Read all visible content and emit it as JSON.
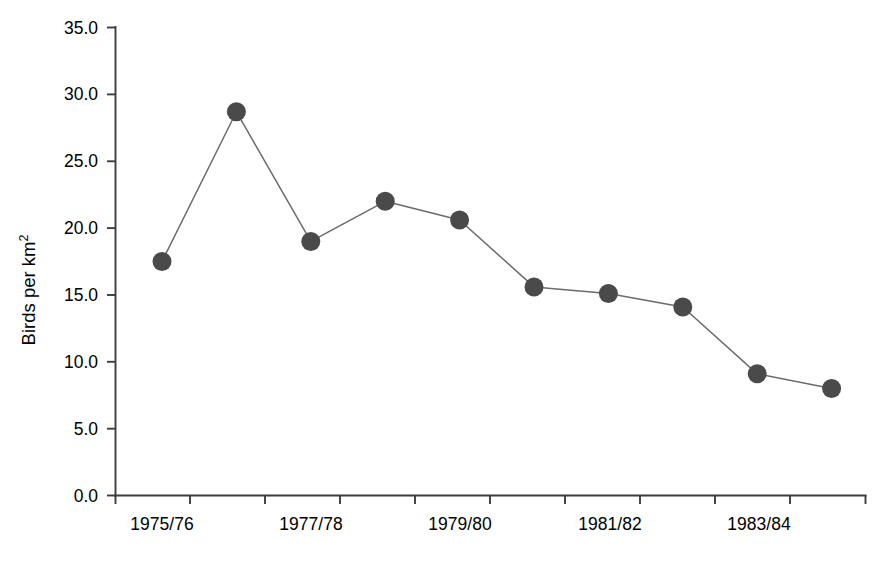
{
  "chart_data": {
    "type": "line",
    "title": "",
    "xlabel": "",
    "ylabel": "Birds per km²",
    "ylabel_base": "Birds per km",
    "ylabel_superscript": "2",
    "ylim": [
      0.0,
      35.0
    ],
    "ytick_step": 5.0,
    "ytick_labels": [
      "35.0",
      "30.0",
      "25.0",
      "20.0",
      "15.0",
      "10.0",
      "5.0",
      "0.0"
    ],
    "ytick_values": [
      35.0,
      30.0,
      25.0,
      20.0,
      15.0,
      10.0,
      5.0,
      0.0
    ],
    "grid": false,
    "legend": false,
    "marker": "filled-circle",
    "marker_color": "#4a4a4a",
    "line_color": "#6b6b6b",
    "axis_color": "#3d3d3d",
    "categories": [
      "1975/76",
      "1976/77",
      "1977/78",
      "1978/79",
      "1979/80",
      "1980/81",
      "1981/82",
      "1982/83",
      "1983/84",
      "1984/85"
    ],
    "xtick_labels_shown": [
      "1975/76",
      "",
      "1977/78",
      "",
      "1979/80",
      "",
      "1981/82",
      "",
      "1983/84",
      ""
    ],
    "values": [
      17.5,
      28.7,
      19.0,
      22.0,
      20.6,
      15.6,
      15.1,
      14.1,
      9.1,
      8.0
    ],
    "series": [
      {
        "name": "Birds per km²",
        "values": [
          17.5,
          28.7,
          19.0,
          22.0,
          20.6,
          15.6,
          15.1,
          14.1,
          9.1,
          8.0
        ]
      }
    ]
  }
}
